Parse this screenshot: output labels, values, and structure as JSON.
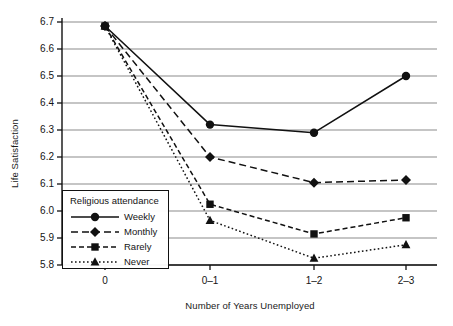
{
  "chart_data": {
    "type": "line",
    "title": "",
    "subtitle": "",
    "xlabel": "Number of Years Unemployed",
    "ylabel": "Life Satisfaction",
    "categories": [
      "0",
      "0–1",
      "1–2",
      "2–3"
    ],
    "ylim": [
      5.8,
      6.7
    ],
    "yticks": [
      "5.8",
      "5.9",
      "6.0",
      "6.1",
      "6.2",
      "6.3",
      "6.4",
      "6.5",
      "6.6",
      "6.7"
    ],
    "ytick_values": [
      5.8,
      5.9,
      6.0,
      6.1,
      6.2,
      6.3,
      6.4,
      6.5,
      6.6,
      6.7
    ],
    "grid": "horizontal",
    "legend_position": "lower-left-inside",
    "legend_title": "Religious attendance",
    "series": [
      {
        "name": "Weekly",
        "values": [
          6.685,
          6.32,
          6.29,
          6.5
        ],
        "linestyle": "solid",
        "marker": "circle",
        "color": "#111111"
      },
      {
        "name": "Monthly",
        "values": [
          6.685,
          6.2,
          6.105,
          6.115
        ],
        "linestyle": "dashed",
        "marker": "diamond",
        "color": "#111111"
      },
      {
        "name": "Rarely",
        "values": [
          6.685,
          6.025,
          5.915,
          5.975
        ],
        "linestyle": "dash-dot",
        "marker": "square",
        "color": "#111111"
      },
      {
        "name": "Never",
        "values": [
          6.685,
          5.965,
          5.825,
          5.875
        ],
        "linestyle": "dotted",
        "marker": "triangle",
        "color": "#111111"
      }
    ]
  },
  "axes": {
    "y_title": "Life Satisfaction",
    "x_title": "Number of Years Unemployed",
    "ytick_labels": [
      "6.7",
      "6.6",
      "6.5",
      "6.4",
      "6.3",
      "6.2",
      "6.1",
      "6.0",
      "5.9",
      "5.8"
    ],
    "xtick_labels": [
      "0",
      "0–1",
      "1–2",
      "2–3"
    ]
  },
  "legend": {
    "title": "Religious attendance",
    "entries": [
      {
        "label": "Weekly",
        "marker": "circle",
        "linestyle": "solid"
      },
      {
        "label": "Monthly",
        "marker": "diamond",
        "linestyle": "dashed"
      },
      {
        "label": "Rarely",
        "marker": "square",
        "linestyle": "dash-dot"
      },
      {
        "label": "Never",
        "marker": "triangle",
        "linestyle": "dotted"
      }
    ]
  },
  "style": {
    "ink": "#111111",
    "grid_color": "#8c8c8c",
    "background": "#ffffff"
  }
}
